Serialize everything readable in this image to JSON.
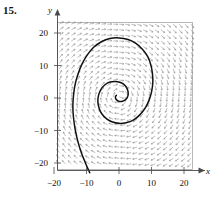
{
  "figure": {
    "problem_number": "15.",
    "type": "direction-field-with-trajectory",
    "caption": ""
  },
  "chart_data": {
    "type": "scatter",
    "title": "",
    "subtitle": "",
    "xlabel": "x",
    "ylabel": "y",
    "xlim": [
      -24,
      24
    ],
    "ylim": [
      -24,
      24
    ],
    "grid": false,
    "legend": null,
    "x_ticks": [
      -20,
      -10,
      0,
      10,
      20
    ],
    "x_tick_labels": [
      "−20",
      "−10",
      "0",
      "10",
      "20"
    ],
    "y_ticks": [
      -20,
      -10,
      0,
      10,
      20
    ],
    "y_tick_labels": [
      "−20",
      "−10",
      "0",
      "10",
      "20"
    ],
    "frame": {
      "x_min": -23.5,
      "x_max": 23.0,
      "y_min": -23.0,
      "y_max": 23.5,
      "visible": true,
      "color": "#9a9a9a"
    },
    "vector_field": {
      "description": "counterclockwise spiral flow toward origin",
      "grid_columns": 25,
      "grid_rows": 27,
      "x_start": -22.0,
      "x_step": 1.84,
      "y_start": -22.0,
      "y_step": 1.72,
      "arrow_color": "#8a8a8a",
      "arrow_length": 4.6,
      "model": {
        "dx_coeff_x": -0.12,
        "dx_coeff_y": 1.0,
        "dy_coeff_x": -1.0,
        "dy_coeff_y": -0.12,
        "note": "dx/dt = -0.12x + y ; dy/dt = -x - 0.12y"
      }
    },
    "trajectory": {
      "color": "#111111",
      "line_width": 1.5,
      "start_point": [
        -9.0,
        -22.5
      ],
      "end_point": [
        -1.0,
        0.6
      ],
      "direction": "inward counterclockwise spiral",
      "points": [
        [
          -9.0,
          -23.0
        ],
        [
          -10.2,
          -20.3
        ],
        [
          -11.6,
          -16.8
        ],
        [
          -12.7,
          -13.2
        ],
        [
          -13.5,
          -9.6
        ],
        [
          -14.0,
          -6.0
        ],
        [
          -14.2,
          -2.6
        ],
        [
          -14.0,
          0.8
        ],
        [
          -13.5,
          4.2
        ],
        [
          -12.6,
          7.4
        ],
        [
          -11.4,
          10.4
        ],
        [
          -9.8,
          13.2
        ],
        [
          -7.8,
          15.6
        ],
        [
          -5.4,
          17.3
        ],
        [
          -2.8,
          18.3
        ],
        [
          0.0,
          18.5
        ],
        [
          2.8,
          18.0
        ],
        [
          5.2,
          16.8
        ],
        [
          7.2,
          15.0
        ],
        [
          8.8,
          12.8
        ],
        [
          9.8,
          10.2
        ],
        [
          10.3,
          7.4
        ],
        [
          10.4,
          4.6
        ],
        [
          10.0,
          1.8
        ],
        [
          9.2,
          -0.8
        ],
        [
          8.0,
          -3.2
        ],
        [
          6.4,
          -5.2
        ],
        [
          4.4,
          -6.8
        ],
        [
          2.2,
          -7.6
        ],
        [
          0.0,
          -7.8
        ],
        [
          -2.0,
          -7.4
        ],
        [
          -3.8,
          -6.4
        ],
        [
          -5.2,
          -5.0
        ],
        [
          -6.1,
          -3.2
        ],
        [
          -6.5,
          -1.2
        ],
        [
          -6.3,
          0.8
        ],
        [
          -5.6,
          2.6
        ],
        [
          -4.4,
          4.0
        ],
        [
          -2.8,
          4.9
        ],
        [
          -1.0,
          5.1
        ],
        [
          0.7,
          4.7
        ],
        [
          2.0,
          3.7
        ],
        [
          2.7,
          2.3
        ],
        [
          2.8,
          0.9
        ],
        [
          2.2,
          -0.3
        ],
        [
          1.1,
          -1.0
        ],
        [
          -0.1,
          -1.0
        ],
        [
          -0.9,
          -0.4
        ],
        [
          -1.1,
          0.4
        ],
        [
          -0.8,
          0.8
        ]
      ]
    }
  },
  "axes": {
    "x_axis": {
      "label": "x",
      "arrow": "right",
      "name": "x-axis"
    },
    "y_axis": {
      "label": "y",
      "arrow": "up",
      "name": "y-axis"
    },
    "axis_color": "#4a4a4a"
  },
  "colors": {
    "background": "#ffffff",
    "axis": "#4a4a4a",
    "frame": "#9a9a9a",
    "arrows": "#8a8a8a",
    "trajectory": "#111111",
    "text": "#111111"
  }
}
